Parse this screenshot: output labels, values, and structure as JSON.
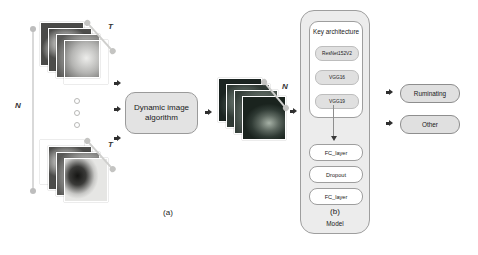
{
  "figure": {
    "panel_a_label": "(a)",
    "panel_b_label": "(b)",
    "model_caption": "Model"
  },
  "axes": {
    "n_vertical": "N",
    "t_top": "T",
    "t_bottom": "T",
    "n_diagonal": "N"
  },
  "process": {
    "dynamic_image_algorithm": "Dynamic image algorithm"
  },
  "model": {
    "key_architecture_title": "Key architecture",
    "architectures": [
      {
        "label": "ResNet152V2"
      },
      {
        "label": "VGG16"
      },
      {
        "label": "VGG19"
      }
    ],
    "head_layers": [
      {
        "label": "FC_layer"
      },
      {
        "label": "Dropout"
      },
      {
        "label": "FC_layer"
      }
    ]
  },
  "outputs": [
    {
      "label": "Ruminating"
    },
    {
      "label": "Other"
    }
  ],
  "colors": {
    "background": "#ffffff",
    "process_fill": "#e3e3e3",
    "model_fill": "#ececec",
    "card_fill": "#ffffff",
    "pill_fill": "#e0e0e0",
    "stroke": "#9e9e9e",
    "text": "#1a1a1a"
  }
}
